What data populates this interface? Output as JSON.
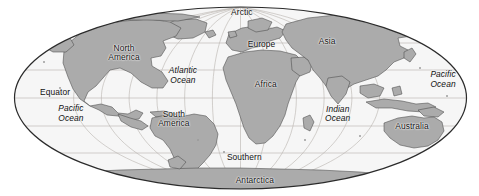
{
  "map": {
    "title": "World map",
    "projection": "elliptical",
    "colors": {
      "land": "#ababab",
      "land_outline": "#4a4a4a",
      "ocean": "#f6f6f6",
      "graticule": "#b9b4ae",
      "border": "#2b2b2b",
      "label": "#111111",
      "background": "#ffffff"
    },
    "graticule": {
      "parallels": [
        60,
        30,
        0,
        -30,
        -60
      ],
      "meridians": [
        -150,
        -120,
        -90,
        -60,
        -30,
        0,
        30,
        60,
        90,
        120,
        150
      ],
      "visible": true
    },
    "labels": [
      {
        "id": "arctic",
        "text": "Arctic",
        "kind": "ocean-name",
        "style": "land",
        "x": 50.5,
        "y": 6.5
      },
      {
        "id": "north-america",
        "text": "North\nAmerica",
        "kind": "continent",
        "style": "land",
        "x": 25.9,
        "y": 27.0
      },
      {
        "id": "south-america",
        "text": "South\nAmerica",
        "kind": "continent",
        "style": "land",
        "x": 36.3,
        "y": 60.5
      },
      {
        "id": "europe",
        "text": "Europe",
        "kind": "continent",
        "style": "land",
        "x": 54.6,
        "y": 23.0
      },
      {
        "id": "africa",
        "text": "Africa",
        "kind": "continent",
        "style": "land",
        "x": 55.5,
        "y": 43.5
      },
      {
        "id": "asia",
        "text": "Asia",
        "kind": "continent",
        "style": "land",
        "x": 68.3,
        "y": 21.2
      },
      {
        "id": "australia",
        "text": "Australia",
        "kind": "continent",
        "style": "land",
        "x": 86.0,
        "y": 65.0
      },
      {
        "id": "antarctica",
        "text": "Antarctica",
        "kind": "continent",
        "style": "land",
        "x": 53.2,
        "y": 92.5
      },
      {
        "id": "atlantic",
        "text": "Atlantic\nOcean",
        "kind": "ocean",
        "style": "ocean",
        "x": 38.2,
        "y": 38.5
      },
      {
        "id": "pacific-west",
        "text": "Pacific\nOcean",
        "kind": "ocean",
        "style": "ocean",
        "x": 14.8,
        "y": 57.8
      },
      {
        "id": "pacific-east",
        "text": "Pacific\nOcean",
        "kind": "ocean",
        "style": "ocean",
        "x": 92.5,
        "y": 40.5
      },
      {
        "id": "indian",
        "text": "Indian\nOcean",
        "kind": "ocean",
        "style": "ocean",
        "x": 70.5,
        "y": 58.0
      },
      {
        "id": "southern",
        "text": "Southern",
        "kind": "ocean-name",
        "style": "land",
        "x": 51.0,
        "y": 80.5
      },
      {
        "id": "equator",
        "text": "Equator",
        "kind": "reference",
        "style": "land",
        "x": 11.5,
        "y": 47.5
      }
    ]
  }
}
